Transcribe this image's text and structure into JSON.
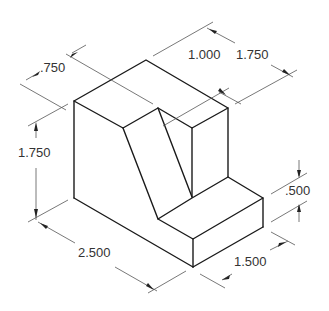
{
  "drawing": {
    "type": "isometric technical drawing with dimensions",
    "colors": {
      "object_line": "#1a1a1a",
      "dimension_line": "#555555",
      "text": "#333333"
    },
    "dimensions": [
      {
        "id": "top-depth",
        "label": ".750"
      },
      {
        "id": "height",
        "label": "1.750"
      },
      {
        "id": "length",
        "label": "2.500"
      },
      {
        "id": "top-width",
        "label": "1.000"
      },
      {
        "id": "overall-width",
        "label": "1.750"
      },
      {
        "id": "step-height",
        "label": ".500"
      },
      {
        "id": "step-width",
        "label": "1.500"
      }
    ]
  }
}
